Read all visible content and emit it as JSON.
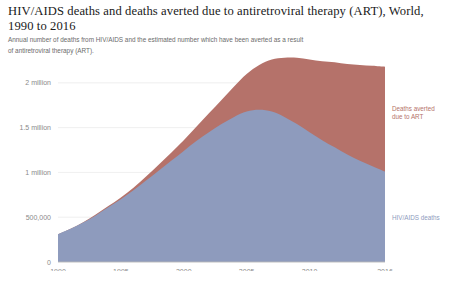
{
  "header": {
    "title": "HIV/AIDS deaths and deaths averted due to antiretroviral therapy (ART), World, 1990 to 2016",
    "subtitle": "Annual number of deaths from HIV/AIDS and the estimated number which have been averted as a result of antiretroviral therapy (ART)."
  },
  "legend": {
    "averted_label_line1": "Deaths averted",
    "averted_label_line2": "due to ART",
    "deaths_label": "HIV/AIDS deaths",
    "averted_color": "#b5726a",
    "deaths_color": "#8e9bbd"
  },
  "chart_data": {
    "type": "area",
    "stacked": true,
    "title": "HIV/AIDS deaths and deaths averted due to antiretroviral therapy (ART), World, 1990 to 2016",
    "subtitle": "Annual number of deaths from HIV/AIDS and the estimated number which have been averted as a result of antiretroviral therapy (ART).",
    "xlabel": "",
    "ylabel": "",
    "grid": true,
    "legend_position": "right-inline",
    "x": [
      1990,
      1991,
      1992,
      1993,
      1994,
      1995,
      1996,
      1997,
      1998,
      1999,
      2000,
      2001,
      2002,
      2003,
      2004,
      2005,
      2006,
      2007,
      2008,
      2009,
      2010,
      2011,
      2012,
      2013,
      2014,
      2015,
      2016
    ],
    "xlim": [
      1990,
      2016
    ],
    "ylim": [
      0,
      2300000
    ],
    "xticks": [
      1990,
      1995,
      2000,
      2005,
      2010,
      2016
    ],
    "xtick_labels": [
      "1990",
      "1995",
      "2000",
      "2005",
      "2010",
      "2016"
    ],
    "yticks": [
      0,
      500000,
      1000000,
      1500000,
      2000000
    ],
    "ytick_labels": [
      "0",
      "500,000",
      "1 million",
      "1.5 million",
      "2 million"
    ],
    "series": [
      {
        "name": "HIV/AIDS deaths",
        "color": "#8e9bbd",
        "values": [
          310000,
          370000,
          440000,
          520000,
          610000,
          700000,
          800000,
          910000,
          1020000,
          1130000,
          1240000,
          1350000,
          1450000,
          1540000,
          1620000,
          1680000,
          1700000,
          1680000,
          1620000,
          1540000,
          1450000,
          1360000,
          1280000,
          1200000,
          1130000,
          1070000,
          1010000
        ]
      },
      {
        "name": "Deaths averted due to ART",
        "color": "#b5726a",
        "values": [
          0,
          2000,
          5000,
          9000,
          14000,
          20000,
          30000,
          45000,
          65000,
          90000,
          120000,
          160000,
          210000,
          270000,
          340000,
          420000,
          500000,
          580000,
          660000,
          740000,
          810000,
          880000,
          950000,
          1010000,
          1070000,
          1120000,
          1170000
        ]
      }
    ],
    "total_values": [
      310000,
      372000,
      445000,
      529000,
      624000,
      720000,
      830000,
      955000,
      1085000,
      1220000,
      1360000,
      1510000,
      1660000,
      1810000,
      1960000,
      2100000,
      2200000,
      2260000,
      2280000,
      2280000,
      2260000,
      2240000,
      2230000,
      2210000,
      2200000,
      2190000,
      2180000
    ]
  }
}
